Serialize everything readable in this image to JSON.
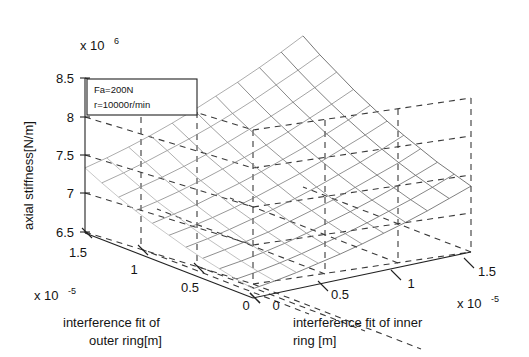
{
  "figure": {
    "kind": "3d-surface-plot",
    "background": "#ffffff",
    "line_color": "#222222"
  },
  "annotation": {
    "line1": "Fa=200N",
    "line2": "r=10000r/min"
  },
  "axes": {
    "z": {
      "title": "axial stiffness[N/m]",
      "exponent_prefix": "x 10",
      "exponent_power": "6",
      "ticks": [
        "8.5",
        "8",
        "7.5",
        "7",
        "6.5"
      ],
      "range": [
        6.5,
        8.5
      ]
    },
    "x_left": {
      "title_line1": "interference fit of",
      "title_line2": "outer ring[m]",
      "exponent_prefix": "x 10",
      "exponent_power": "-5",
      "ticks": [
        "1.5",
        "1",
        "0.5",
        "0"
      ],
      "range": [
        0,
        1.5
      ]
    },
    "y_right": {
      "title_line1": "interference fit of inner",
      "title_line2": "ring [m]",
      "exponent_prefix": "x 10",
      "exponent_power": "-5",
      "ticks": [
        "0",
        "0.5",
        "1",
        "1.5"
      ],
      "range": [
        0,
        1.5
      ]
    }
  },
  "chart_data": {
    "type": "surface",
    "title": "",
    "xlabel": "interference fit of outer ring[m]",
    "ylabel": "interference fit of inner ring [m]",
    "zlabel": "axial stiffness[N/m]",
    "xlim": [
      0,
      1.5e-05
    ],
    "ylim": [
      0,
      1.5e-05
    ],
    "zlim": [
      6500000.0,
      8500000.0
    ],
    "x_tick_labels": [
      "0",
      "0.5",
      "1",
      "1.5"
    ],
    "y_tick_labels": [
      "0",
      "0.5",
      "1",
      "1.5"
    ],
    "z_tick_labels": [
      "6.5",
      "7",
      "7.5",
      "8",
      "8.5"
    ],
    "x_exponent": -5,
    "y_exponent": -5,
    "z_exponent": 6,
    "grid": true,
    "legend": null,
    "annotations": [
      "Fa=200N",
      "r=10000r/min"
    ],
    "mesh_n": 11,
    "x_values": [
      0,
      1.5e-06,
      3e-06,
      4.5e-06,
      6e-06,
      7.5e-06,
      9e-06,
      1.05e-05,
      1.2e-05,
      1.35e-05,
      1.5e-05
    ],
    "y_values": [
      0,
      1.5e-06,
      3e-06,
      4.5e-06,
      6e-06,
      7.5e-06,
      9e-06,
      1.05e-05,
      1.2e-05,
      1.35e-05,
      1.5e-05
    ],
    "z_values": [
      [
        6.62,
        6.66,
        6.71,
        6.77,
        6.83,
        6.9,
        6.98,
        7.06,
        7.15,
        7.25,
        7.35
      ],
      [
        6.66,
        6.7,
        6.75,
        6.81,
        6.88,
        6.95,
        7.03,
        7.12,
        7.21,
        7.31,
        7.42
      ],
      [
        6.71,
        6.75,
        6.8,
        6.86,
        6.93,
        7.01,
        7.09,
        7.18,
        7.28,
        7.38,
        7.49
      ],
      [
        6.76,
        6.81,
        6.86,
        6.92,
        7.0,
        7.08,
        7.16,
        7.26,
        7.36,
        7.46,
        7.58
      ],
      [
        6.82,
        6.87,
        6.93,
        7.0,
        7.07,
        7.15,
        7.24,
        7.34,
        7.44,
        7.55,
        7.67
      ],
      [
        6.89,
        6.94,
        7.0,
        7.07,
        7.15,
        7.24,
        7.33,
        7.43,
        7.54,
        7.65,
        7.77
      ],
      [
        6.96,
        7.02,
        7.08,
        7.16,
        7.24,
        7.33,
        7.43,
        7.53,
        7.64,
        7.76,
        7.89
      ],
      [
        7.04,
        7.1,
        7.17,
        7.25,
        7.34,
        7.43,
        7.53,
        7.64,
        7.76,
        7.88,
        8.01
      ],
      [
        7.13,
        7.2,
        7.27,
        7.35,
        7.44,
        7.54,
        7.65,
        7.76,
        7.88,
        8.01,
        8.15
      ],
      [
        7.23,
        7.3,
        7.38,
        7.47,
        7.56,
        7.66,
        7.77,
        7.89,
        8.02,
        8.15,
        8.29
      ],
      [
        7.34,
        7.41,
        7.49,
        7.58,
        7.68,
        7.79,
        7.91,
        8.03,
        8.16,
        8.3,
        8.45
      ]
    ],
    "z_unit_scale": 1000000,
    "surface_shading": "monochrome-wireframe"
  }
}
